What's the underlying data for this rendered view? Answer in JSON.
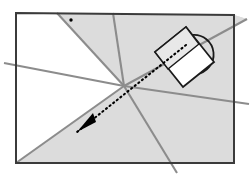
{
  "figure": {
    "canvas": {
      "width": 250,
      "height": 177,
      "background": "#ffffff"
    },
    "colors": {
      "frame_stroke": "#3b3b3b",
      "ray_stroke": "#8c8c8c",
      "shaded_fill": "#dcdcdc",
      "object_stroke": "#1a1a1a",
      "object_fill_body": "#ffffff",
      "object_fill_top": "#e8e8e8",
      "arrow_color": "#000000",
      "dot_color": "#000000"
    },
    "frame": {
      "label": "image-frame-rectangle",
      "top_left": {
        "x": 16,
        "y": 13
      },
      "top_right": {
        "x": 234,
        "y": 15
      },
      "bottom_right": {
        "x": 234,
        "y": 163
      },
      "bottom_left": {
        "x": 16,
        "y": 163
      },
      "stroke_width": 2
    },
    "vanishing_point": {
      "label": "vanishing-point",
      "x": 124,
      "y": 86
    },
    "rays": [
      {
        "name": "ray-to-upper-left",
        "x1": 124,
        "y1": 86,
        "x2": 57,
        "y2": 13
      },
      {
        "name": "ray-to-top-edge",
        "x1": 124,
        "y1": 86,
        "x2": 113,
        "y2": 13
      },
      {
        "name": "ray-to-upper-right",
        "x1": 124,
        "y1": 86,
        "x2": 247,
        "y2": 19
      },
      {
        "name": "ray-to-left-edge",
        "x1": 124,
        "y1": 86,
        "x2": 4,
        "y2": 63
      },
      {
        "name": "ray-to-right-edge",
        "x1": 124,
        "y1": 86,
        "x2": 249,
        "y2": 104
      },
      {
        "name": "ray-to-bottom-left-corner",
        "x1": 124,
        "y1": 86,
        "x2": 16,
        "y2": 163
      },
      {
        "name": "ray-to-bottom-edge",
        "x1": 124,
        "y1": 86,
        "x2": 177,
        "y2": 173
      }
    ],
    "shaded_region": {
      "name": "shaded-ground-plane",
      "points": "124,86 16,163 234,163 234,15 247,19 124,86"
    },
    "shaded_region_upper": {
      "name": "shaded-upper-wedge",
      "points": "124,86 57,13 234,15 247,19"
    },
    "mug": {
      "name": "mug-object",
      "rotation_deg": -37,
      "body": {
        "name": "mug-body-rectangle",
        "points": "155,52 186,27 214,62 183,87"
      },
      "top_band": {
        "name": "mug-top-band",
        "points": "155,52 186,27 199,44 168,69"
      },
      "handle": {
        "name": "mug-handle-arc",
        "path": "M 192,35 A 19,19 0 0 1 196,74"
      }
    },
    "arrow": {
      "name": "direction-arrow",
      "style": "dotted-with-solid-head",
      "tail": {
        "x": 186,
        "y": 45
      },
      "head": {
        "x": 77,
        "y": 132
      },
      "head_points": "77,132 96,122 93,113"
    },
    "marker_dot": {
      "name": "reference-point-dot",
      "x": 71,
      "y": 20,
      "radius": 1.7
    }
  }
}
